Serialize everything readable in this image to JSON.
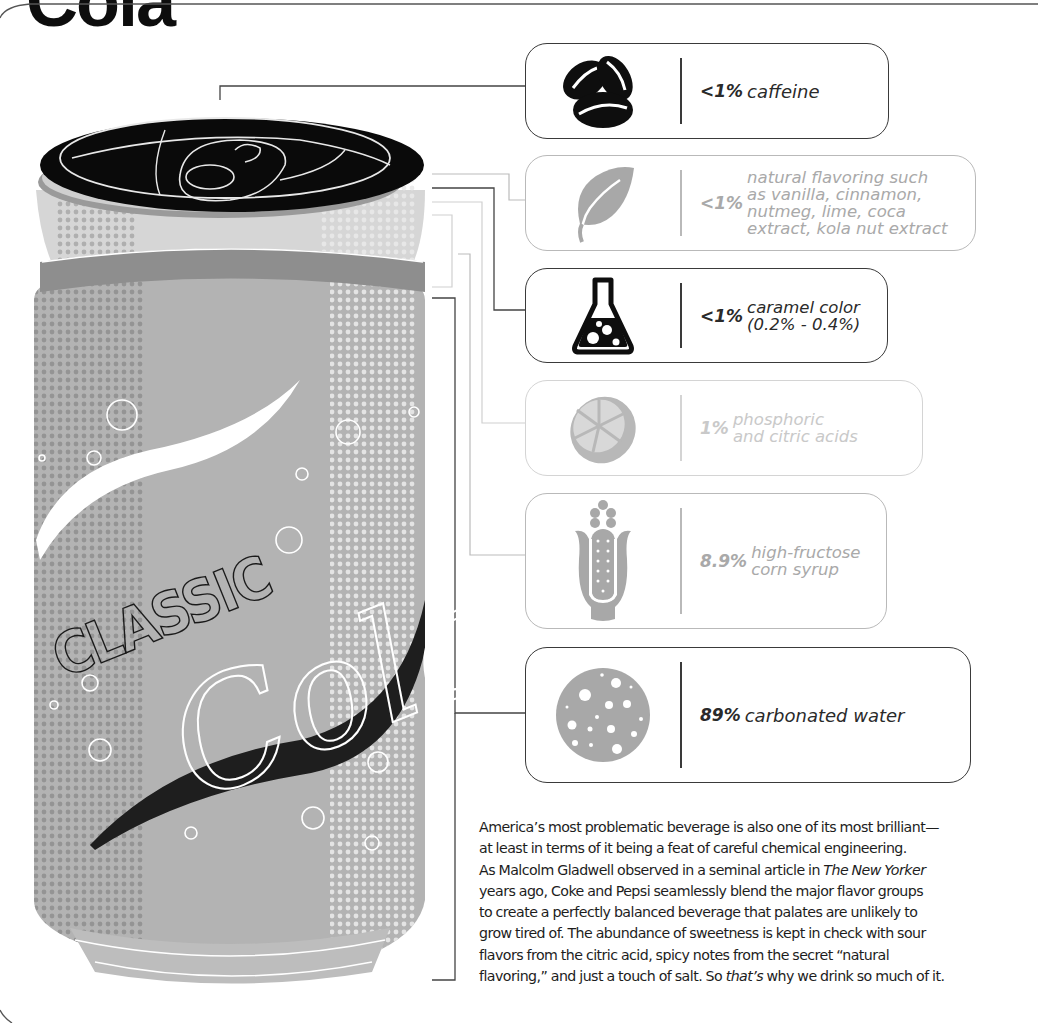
{
  "header": {
    "title_fragment": "Cola"
  },
  "can": {
    "brand_top": "CLASSIC",
    "brand_script": "Cola",
    "colors": {
      "lid": "#0a0a0a",
      "body": "#b3b3b3",
      "shoulder": "#d6d6d6",
      "dark_band": "#8e8e8e",
      "swoosh_dark": "#222222",
      "swoosh_light": "#ffffff"
    }
  },
  "ingredients": [
    {
      "icon": "coffee-beans-icon",
      "percent": "<1%",
      "description": "caffeine",
      "emphasis": "dark"
    },
    {
      "icon": "leaf-icon",
      "percent": "<1%",
      "description": "natural flavoring such\nas vanilla, cinnamon,\nnutmeg, lime, coca\nextract, kola nut extract",
      "emphasis": "light"
    },
    {
      "icon": "flask-icon",
      "percent": "<1%",
      "description": "caramel color\n(0.2% - 0.4%)",
      "emphasis": "dark"
    },
    {
      "icon": "lemon-slice-icon",
      "percent": "1%",
      "description": "phosphoric\nand citric acids",
      "emphasis": "lighter"
    },
    {
      "icon": "corn-icon",
      "percent": "8.9%",
      "description": "high-fructose\ncorn syrup",
      "emphasis": "light"
    },
    {
      "icon": "bubbles-icon",
      "percent": "89%",
      "description": "carbonated water",
      "emphasis": "dark"
    }
  ],
  "body_text": {
    "lines": [
      "America’s most problematic beverage is also one of its most brilliant—",
      "at least in terms of it being a feat of careful chemical engineering.",
      "As Malcolm Gladwell observed in a seminal article in ",
      "The New Yorker",
      "years ago, Coke and Pepsi seamlessly blend the major flavor groups",
      "to create a perfectly balanced beverage that palates are unlikely to",
      "grow tired of. The abundance of sweetness is kept in check with sour",
      "flavors from the citric acid, spicy notes from the secret “natural",
      "flavoring,” and just a touch of salt. So ",
      "that’s",
      " why we drink so much of it."
    ]
  },
  "colors": {
    "dark_border": "#3a3a3a",
    "light_border": "#b9b9b9",
    "lighter_border": "#d4d4d4",
    "icon_gray": "#a8a8a8"
  }
}
